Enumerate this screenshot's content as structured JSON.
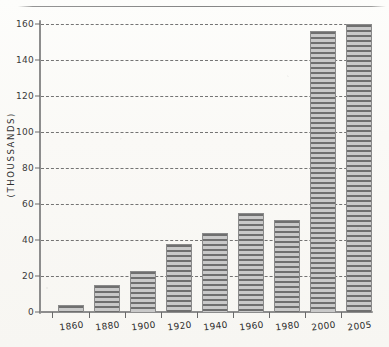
{
  "chart_data": {
    "type": "bar",
    "title": "",
    "xlabel": "",
    "ylabel": "(THOUSSANDS)",
    "categories": [
      "1860",
      "1880",
      "1900",
      "1920",
      "1940",
      "1960",
      "1980",
      "2000",
      "2005"
    ],
    "values": [
      4,
      15,
      23,
      38,
      44,
      55,
      51,
      156,
      160
    ],
    "ylim": [
      0,
      160
    ],
    "yticks": [
      0,
      20,
      40,
      60,
      80,
      100,
      120,
      140,
      160
    ],
    "ytick_labels": [
      "0",
      "20",
      "40",
      "60",
      "80",
      "100",
      "120",
      "140",
      "160"
    ],
    "grid": true,
    "grid_style": "dashed-horizontal",
    "legend": null,
    "bar_fill": "horizontal-stripe-hatch",
    "colors": {
      "bar_fill_dark": "#6f6f6f",
      "bar_fill_light": "#c9c9c9",
      "bar_border": "#8a8a8a",
      "axis": "#8d8d8d",
      "gridline": "#5d5d5d",
      "text": "#2b2b2b",
      "background": "#fbfaf7"
    }
  }
}
